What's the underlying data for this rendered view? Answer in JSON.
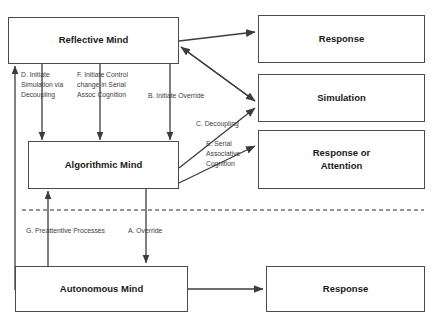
{
  "diagram": {
    "line_color": "#3c3c3c",
    "box_border_color": "#4a4a4a",
    "text_color": "#1a1a1a",
    "label_color": "#3d3d3d",
    "background": "#ffffff",
    "divider": {
      "name": "dashed-divider",
      "style": "dashed"
    }
  },
  "boxes": {
    "reflective_mind": "Reflective Mind",
    "algorithmic_mind": "Algorithmic Mind",
    "autonomous_mind": "Autonomous Mind",
    "response_top": "Response",
    "simulation": "Simulation",
    "response_or_attention": "Response or\nAttention",
    "response_bottom": "Response"
  },
  "labels": {
    "d_initiate_simulation": "D. Initiate\nSimulation via\nDecoupling",
    "f_initiate_control": "F. Initiate Control\nchange in Serial\nAssoc Cognition",
    "b_initiate_override": "B. Initiate Override",
    "c_decoupling": "C. Decoupling",
    "e_serial_associative": "E. Serial\nAssociative\nCognition",
    "g_preattentive": "G. Preattentive Processes",
    "a_override": "A. Override"
  }
}
